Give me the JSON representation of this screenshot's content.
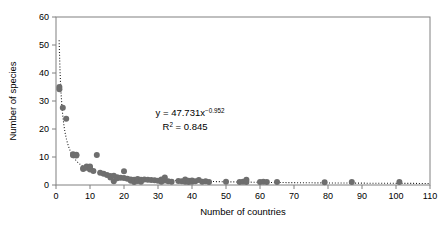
{
  "chart_data": {
    "type": "scatter",
    "title": "",
    "xlabel": "Number of countries",
    "ylabel": "Number of species",
    "xlim": [
      0,
      110
    ],
    "ylim": [
      0,
      60
    ],
    "xticks": [
      0,
      10,
      20,
      30,
      40,
      50,
      60,
      70,
      80,
      90,
      100,
      110
    ],
    "yticks": [
      0,
      10,
      20,
      30,
      40,
      50,
      60
    ],
    "grid": false,
    "legend": null,
    "annotations": {
      "equation_prefix": "y = 47.731x",
      "equation_exponent": "−0.952",
      "r2_prefix": "R",
      "r2_sup": "2",
      "r2_value": " = 0.845"
    },
    "fit": {
      "type": "power",
      "a": 47.731,
      "b": -0.952,
      "r2": 0.845,
      "style": "dotted"
    },
    "marker": {
      "shape": "circle",
      "color": "#6e6e6e",
      "size": 3.0
    },
    "points": [
      [
        1,
        35.0
      ],
      [
        1,
        34.2
      ],
      [
        2,
        27.6
      ],
      [
        3,
        23.7
      ],
      [
        5,
        11.0
      ],
      [
        5,
        10.6
      ],
      [
        6,
        10.8
      ],
      [
        6,
        10.5
      ],
      [
        8,
        6.0
      ],
      [
        8,
        5.7
      ],
      [
        9,
        6.6
      ],
      [
        9,
        6.2
      ],
      [
        10,
        6.6
      ],
      [
        10,
        6.1
      ],
      [
        10,
        5.5
      ],
      [
        11,
        5.0
      ],
      [
        12,
        10.7
      ],
      [
        13,
        4.4
      ],
      [
        14,
        4.0
      ],
      [
        15,
        3.6
      ],
      [
        16,
        3.2
      ],
      [
        16,
        2.7
      ],
      [
        17,
        3.3
      ],
      [
        17,
        1.3
      ],
      [
        18,
        2.8
      ],
      [
        18,
        2.4
      ],
      [
        19,
        2.6
      ],
      [
        20,
        4.9
      ],
      [
        20,
        2.5
      ],
      [
        21,
        2.2
      ],
      [
        22,
        2.0
      ],
      [
        22,
        1.5
      ],
      [
        23,
        1.9
      ],
      [
        23,
        1.1
      ],
      [
        24,
        2.1
      ],
      [
        24,
        1.4
      ],
      [
        25,
        1.9
      ],
      [
        25,
        1.2
      ],
      [
        26,
        2.0
      ],
      [
        27,
        1.9
      ],
      [
        28,
        1.8
      ],
      [
        29,
        1.7
      ],
      [
        30,
        1.5
      ],
      [
        31,
        2.0
      ],
      [
        31,
        1.2
      ],
      [
        32,
        2.7
      ],
      [
        32,
        1.6
      ],
      [
        33,
        1.3
      ],
      [
        34,
        1.2
      ],
      [
        36,
        1.4
      ],
      [
        37,
        1.3
      ],
      [
        38,
        2.0
      ],
      [
        38,
        1.2
      ],
      [
        39,
        1.5
      ],
      [
        39,
        1.1
      ],
      [
        40,
        1.6
      ],
      [
        40,
        1.2
      ],
      [
        41,
        1.3
      ],
      [
        42,
        1.8
      ],
      [
        43,
        1.2
      ],
      [
        44,
        1.3
      ],
      [
        45,
        1.1
      ],
      [
        50,
        1.2
      ],
      [
        54,
        1.1
      ],
      [
        55,
        1.2
      ],
      [
        56,
        1.9
      ],
      [
        56,
        1.1
      ],
      [
        60,
        1.1
      ],
      [
        61,
        1.2
      ],
      [
        62,
        1.1
      ],
      [
        65,
        1.1
      ],
      [
        79,
        1.0
      ],
      [
        87,
        1.1
      ],
      [
        101,
        1.1
      ]
    ]
  }
}
